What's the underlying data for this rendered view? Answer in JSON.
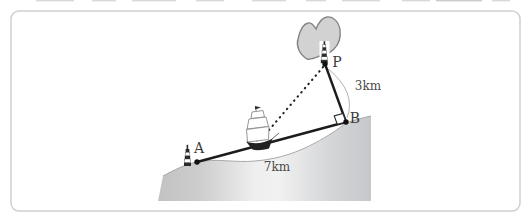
{
  "figure": {
    "type": "geometry-diagram",
    "scene": "A ship at sea on sight line AB between a lighthouse at A and point B on the shore; P is a beacon on a small island, PB perpendicular at B",
    "panel": {
      "border_color": "#cfcfcf",
      "background": "#ffffff"
    }
  },
  "diagram": {
    "points": {
      "A": {
        "label": "A"
      },
      "B": {
        "label": "B"
      },
      "P": {
        "label": "P"
      }
    },
    "measurements": {
      "pb_distance": "3km",
      "ab_distance": "7km"
    },
    "colors": {
      "solid_line": "#1c1c1c",
      "dotted_line": "#222222",
      "measure_arc": "#b3b3b3",
      "shore_edge": "#a9a9a9",
      "land_dark": "#c3c3c3",
      "land_light": "#f0f0f0",
      "island_fill": "#d2d2d2",
      "island_outline": "#858585",
      "label_text": "#3c3c3c",
      "icon_dark": "#2b2b2b"
    },
    "icons": {
      "lighthouse-icon": "striped beacon tower at point A",
      "survey-tower-icon": "striped beacon tower at point P",
      "ship-icon": "small sailing ship between A and B",
      "island-icon": "gray island blob around P",
      "right-angle-icon": "small square marking the right angle at B"
    }
  }
}
